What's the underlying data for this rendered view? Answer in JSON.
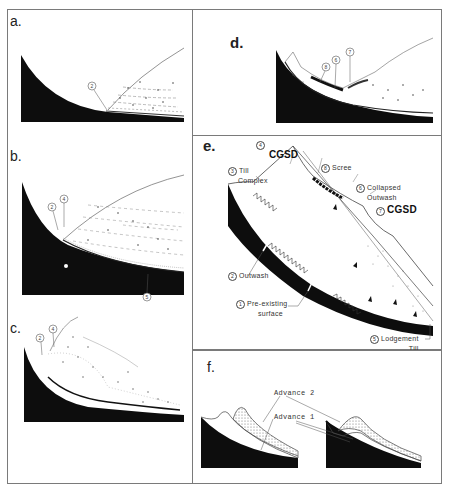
{
  "figure": {
    "panels": [
      {
        "id": "a",
        "label": "a.",
        "callouts": [
          "2"
        ]
      },
      {
        "id": "b",
        "label": "b.",
        "callouts": [
          "2",
          "4",
          "5"
        ]
      },
      {
        "id": "c",
        "label": "c.",
        "callouts": [
          "2",
          "4"
        ]
      },
      {
        "id": "d",
        "label": "d.",
        "callouts": [
          "8",
          "6",
          "7"
        ]
      },
      {
        "id": "e",
        "label": "e."
      },
      {
        "id": "f",
        "label": "f."
      }
    ],
    "panel_e": {
      "circle_4": "4",
      "cgsd_top": "CGSD",
      "till_complex_num": "3",
      "till_complex_line1": "Till",
      "till_complex_line2": "Complex",
      "scree_num": "8",
      "scree": "Scree",
      "collapsed_num": "6",
      "collapsed_line1": "Collapsed",
      "collapsed_line2": "Outwash",
      "cgsd_right_num": "7",
      "cgsd_right": "CGSD",
      "outwash_num": "2",
      "outwash": "Outwash",
      "preexisting_num": "1",
      "preexisting_line1": "Pre-existing",
      "preexisting_line2": "surface",
      "lodgement_num": "5",
      "lodgement_line1": "Lodgement",
      "lodgement_line2": "Till"
    },
    "panel_f": {
      "advance2": "Advance 2",
      "advance1": "Advance 1"
    },
    "colors": {
      "bedrock": "#0d0d0d",
      "line": "#4a4a4a",
      "stipple": "#555555",
      "border": "#7a7a7a"
    }
  }
}
